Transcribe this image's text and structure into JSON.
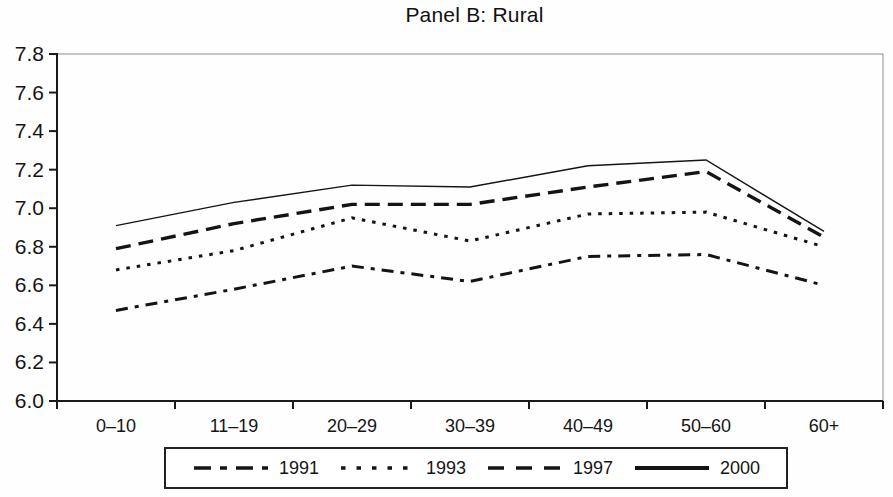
{
  "title": "Panel B: Rural",
  "colors": {
    "ink": "#141414",
    "frame": "#8d8d8d",
    "background": "#ffffff"
  },
  "chart_data": {
    "type": "line",
    "title": "Panel B: Rural",
    "categories": [
      "0–10",
      "11–19",
      "20–29",
      "30–39",
      "40–49",
      "50–60",
      "60+"
    ],
    "series": [
      {
        "name": "1991",
        "style": "dashdot",
        "values": [
          6.47,
          6.58,
          6.7,
          6.62,
          6.75,
          6.76,
          6.6
        ]
      },
      {
        "name": "1993",
        "style": "dotted",
        "values": [
          6.68,
          6.78,
          6.95,
          6.83,
          6.97,
          6.98,
          6.8
        ]
      },
      {
        "name": "1997",
        "style": "dashed",
        "values": [
          6.79,
          6.92,
          7.02,
          7.02,
          7.11,
          7.19,
          6.85
        ]
      },
      {
        "name": "2000",
        "style": "solid",
        "values": [
          6.91,
          7.03,
          7.12,
          7.11,
          7.22,
          7.25,
          6.88
        ]
      }
    ],
    "xlabel": "",
    "ylabel": "",
    "ylim": [
      6.0,
      7.8
    ],
    "ytick_step": 0.2,
    "ytick_labels": [
      "7.8",
      "7.6",
      "7.4",
      "7.2",
      "7.0",
      "6.8",
      "6.6",
      "6.4",
      "6.2",
      "6.0"
    ],
    "grid": false,
    "legend_position": "bottom"
  }
}
